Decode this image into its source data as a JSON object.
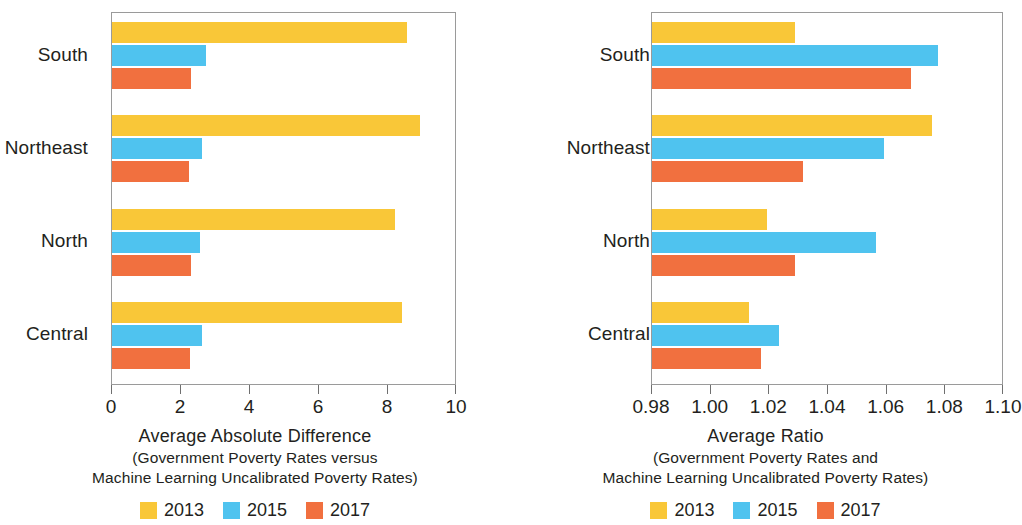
{
  "legend": {
    "position": "bottom-center",
    "entries": [
      {
        "label": "2013",
        "color": "#f9c738"
      },
      {
        "label": "2015",
        "color": "#4fc3ef"
      },
      {
        "label": "2017",
        "color": "#f1703f"
      }
    ]
  },
  "chart_data": [
    {
      "type": "bar",
      "orientation": "horizontal",
      "panel": "left",
      "title": "",
      "xlabel": "Average Absolute Difference",
      "xlabel_sub1": "(Government Poverty Rates versus",
      "xlabel_sub2": "Machine Learning Uncalibrated Poverty Rates)",
      "ylabel": "",
      "categories": [
        "South",
        "Northeast",
        "North",
        "Central"
      ],
      "xlim": [
        0,
        10
      ],
      "xticks": [
        0,
        2,
        4,
        6,
        8,
        10
      ],
      "xticklabels": [
        "0",
        "2",
        "4",
        "6",
        "8",
        "10"
      ],
      "grid": false,
      "series": [
        {
          "name": "2013",
          "color": "#f9c738",
          "values": [
            8.55,
            8.93,
            8.2,
            8.4
          ]
        },
        {
          "name": "2015",
          "color": "#4fc3ef",
          "values": [
            2.72,
            2.6,
            2.55,
            2.62
          ]
        },
        {
          "name": "2017",
          "color": "#f1703f",
          "values": [
            2.3,
            2.24,
            2.3,
            2.26
          ]
        }
      ]
    },
    {
      "type": "bar",
      "orientation": "horizontal",
      "panel": "right",
      "title": "",
      "xlabel": "Average Ratio",
      "xlabel_sub1": "(Government Poverty Rates and",
      "xlabel_sub2": "Machine Learning Uncalibrated Poverty Rates)",
      "ylabel": "",
      "categories": [
        "South",
        "Northeast",
        "North",
        "Central"
      ],
      "xlim": [
        0.98,
        1.1
      ],
      "xticks": [
        0.98,
        1.0,
        1.02,
        1.04,
        1.06,
        1.08,
        1.1
      ],
      "xticklabels": [
        "0.98",
        "1.00",
        "1.02",
        "1.04",
        "1.06",
        "1.08",
        "1.10"
      ],
      "grid": false,
      "series": [
        {
          "name": "2013",
          "color": "#f9c738",
          "values": [
            1.0288,
            1.0753,
            1.0193,
            1.0131
          ]
        },
        {
          "name": "2015",
          "color": "#4fc3ef",
          "values": [
            1.0774,
            1.0592,
            1.0562,
            1.0233
          ]
        },
        {
          "name": "2017",
          "color": "#f1703f",
          "values": [
            1.0684,
            1.0315,
            1.0287,
            1.0173
          ]
        }
      ]
    }
  ]
}
